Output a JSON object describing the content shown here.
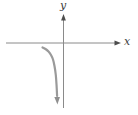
{
  "colors": {
    "background": "#ffffff",
    "axis_line": "#8a8a8a",
    "axis_arrow": "#4d4d4d",
    "curve": "#9a9a9a",
    "curve_arrow": "#8f8f8f",
    "label_text": "#3c3c3c"
  },
  "chart_data": {
    "type": "line",
    "title": "",
    "xlabel": "x",
    "ylabel": "y",
    "grid": false,
    "legend": false,
    "axis_ranges": {
      "x": [
        -3,
        3
      ],
      "y": [
        -3.5,
        1.5
      ]
    },
    "canvas_px": {
      "width": 138,
      "height": 115
    },
    "axes_px": {
      "origin": [
        63.5,
        43
      ],
      "x_axis": {
        "from": [
          6,
          43
        ],
        "to": [
          121,
          43
        ]
      },
      "y_axis": {
        "from": [
          63.5,
          108
        ],
        "to": [
          63.5,
          14
        ]
      }
    },
    "series": [
      {
        "name": "curve",
        "description": "Branch resembling y = 1/x for x < 0: y -> 0- as x -> -infinity, y -> -infinity as x -> 0-; drawn ending in a downward arrow.",
        "math_points": [
          [
            -1.1,
            -0.23
          ],
          [
            -0.95,
            -0.3
          ],
          [
            -0.75,
            -0.48
          ],
          [
            -0.6,
            -0.75
          ],
          [
            -0.5,
            -1.1
          ],
          [
            -0.42,
            -1.6
          ],
          [
            -0.36,
            -2.25
          ],
          [
            -0.33,
            -2.9
          ],
          [
            -0.32,
            -3.2
          ]
        ],
        "points_px": [
          [
            42.5,
            47.5
          ],
          [
            45.5,
            49
          ],
          [
            48.5,
            51.5
          ],
          [
            51,
            55
          ],
          [
            53,
            59.5
          ],
          [
            54.5,
            66
          ],
          [
            55.8,
            75
          ],
          [
            56.6,
            86
          ],
          [
            57.1,
            96
          ]
        ],
        "arrow_end_px": [
          57.4,
          104.5
        ],
        "end_arrow": "down"
      }
    ]
  }
}
